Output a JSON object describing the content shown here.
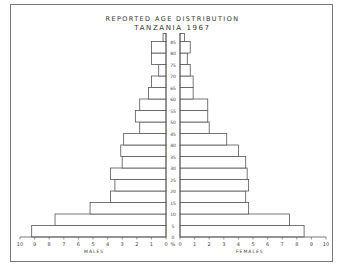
{
  "title": "REPORTED AGE DISTRIBUTION",
  "subtitle": "TANZANIA 1967",
  "chart_data": {
    "type": "bar",
    "subtype": "population-pyramid",
    "categories": [
      "0",
      "5",
      "10",
      "15",
      "20",
      "25",
      "30",
      "35",
      "40",
      "45",
      "50",
      "55",
      "60",
      "65",
      "70",
      "75",
      "80",
      "85"
    ],
    "series": [
      {
        "name": "MALES",
        "values": [
          9.2,
          7.6,
          5.2,
          3.8,
          3.5,
          3.8,
          3.0,
          3.1,
          2.9,
          1.8,
          2.1,
          1.8,
          1.2,
          1.0,
          0.5,
          1.0,
          1.0,
          0.2
        ]
      },
      {
        "name": "FEMALES",
        "values": [
          8.5,
          7.5,
          4.7,
          4.5,
          4.7,
          4.6,
          4.5,
          4.0,
          3.2,
          2.0,
          1.9,
          1.9,
          0.9,
          0.9,
          0.7,
          0.5,
          0.7,
          0.3
        ]
      }
    ],
    "xlabel_left": "MALES",
    "xlabel_right": "FEMALES",
    "ylabel": "",
    "x_ticks": [
      "10",
      "9",
      "8",
      "7",
      "6",
      "5",
      "4",
      "3",
      "2",
      "1",
      "0 %",
      "0",
      "1",
      "2",
      "3",
      "4",
      "5",
      "6",
      "7",
      "8",
      "9",
      "10"
    ],
    "xlim": [
      0,
      10
    ],
    "unit": "%",
    "grid": false
  },
  "axis": {
    "males_label": "MALES",
    "females_label": "FEMALES",
    "percent": "%"
  }
}
